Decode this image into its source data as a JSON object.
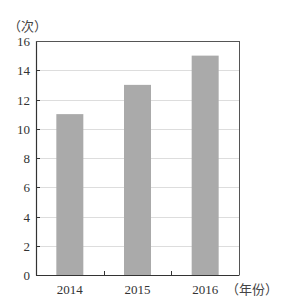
{
  "chart_data": {
    "type": "bar",
    "title": "",
    "xlabel": "（年份）",
    "ylabel": "（次）",
    "categories": [
      "2014",
      "2015",
      "2016"
    ],
    "values": [
      11,
      13,
      15
    ],
    "ylim": [
      0,
      16
    ],
    "yticks": [
      0,
      2,
      4,
      6,
      8,
      10,
      12,
      14,
      16
    ],
    "grid": true,
    "legend": null,
    "bar_color": "#aaaaaa",
    "grid_color": "#dddddd",
    "axis_color": "#333333"
  }
}
